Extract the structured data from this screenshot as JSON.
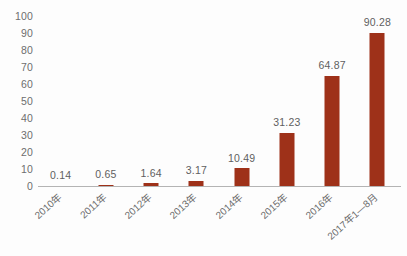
{
  "chart_data": {
    "type": "bar",
    "title": "",
    "subtitle": "",
    "xlabel": "",
    "ylabel": "",
    "categories": [
      "2010年",
      "2011年",
      "2012年",
      "2013年",
      "2014年",
      "2015年",
      "2016年",
      "2017年1—8月"
    ],
    "values": [
      0.14,
      0.65,
      1.64,
      3.17,
      10.49,
      31.23,
      64.87,
      90.28
    ],
    "value_labels": [
      "0.14",
      "0.65",
      "1.64",
      "3.17",
      "10.49",
      "31.23",
      "64.87",
      "90.28"
    ],
    "ylim": [
      0,
      100
    ],
    "ytick_step": 10,
    "yticks": [
      100,
      90,
      80,
      70,
      60,
      50,
      40,
      30,
      20,
      10,
      0
    ],
    "ytick_labels": [
      "100",
      "90",
      "80",
      "70",
      "60",
      "50",
      "40",
      "30",
      "20",
      "10",
      "0"
    ],
    "grid": false,
    "legend": null,
    "legend_position": "none",
    "series": [
      {
        "name": "",
        "values": [
          0.14,
          0.65,
          1.64,
          3.17,
          10.49,
          31.23,
          64.87,
          90.28
        ]
      }
    ],
    "bar_color": "#9e3119",
    "axis_color": "#b4b4b4",
    "text_color": "#6b6b6b",
    "background": "#fdfdfd",
    "xlabel_rotation_deg": -42
  }
}
